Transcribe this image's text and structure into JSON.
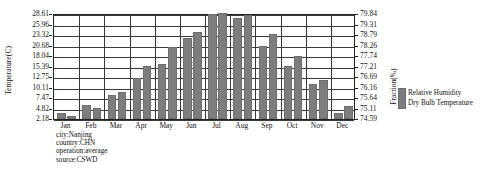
{
  "chart_data": {
    "type": "bar",
    "title": "",
    "categories": [
      "Jan",
      "Feb",
      "Mar",
      "Apr",
      "May",
      "Jun",
      "Jul",
      "Aug",
      "Sep",
      "Oct",
      "Nov",
      "Dec"
    ],
    "series": [
      {
        "name": "Relative Humidity",
        "axis": "right",
        "unit": "%",
        "values": [
          74.9,
          75.3,
          75.8,
          76.6,
          77.3,
          78.6,
          79.8,
          79.6,
          78.2,
          77.2,
          76.3,
          74.9
        ]
      },
      {
        "name": "Dry Bulb Temperature",
        "axis": "left",
        "unit": "C",
        "values": [
          2.9,
          5.0,
          9.0,
          15.3,
          20.1,
          24.0,
          28.6,
          28.2,
          23.5,
          18.0,
          11.8,
          5.4
        ]
      }
    ],
    "xlabel": "",
    "ylabel": "Temperature(C)",
    "y2label": "Fraction(%)",
    "ylim": [
      2.18,
      28.61
    ],
    "y2lim": [
      74.59,
      79.84
    ],
    "yticks": [
      "28.61",
      "25.96",
      "23.32",
      "20.68",
      "18.04",
      "15.39",
      "12.75",
      "10.11",
      "7.47",
      "4.82",
      "2.18"
    ],
    "y2ticks": [
      "79.84",
      "79.31",
      "78.79",
      "78.26",
      "77.74",
      "77.21",
      "76.69",
      "76.16",
      "75.64",
      "75.11",
      "74.59"
    ],
    "grid": true,
    "legend_position": "right",
    "legend": [
      "Relative Humidity",
      "Dry Bulb Temperature"
    ],
    "annotations": [
      "city:Nanjing",
      "country:CHN",
      "operation:average",
      "source:CSWD"
    ],
    "bar_color": "#7d7d7d"
  }
}
